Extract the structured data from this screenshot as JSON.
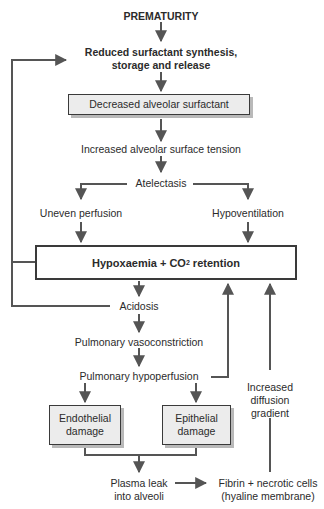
{
  "diagram": {
    "nodes": {
      "prematurity": "PREMATURITY",
      "reduced_synthesis_line1": "Reduced surfactant synthesis,",
      "reduced_synthesis_line2": "storage and release",
      "decreased_surfactant": "Decreased alveolar surfactant",
      "surface_tension": "Increased alveolar surface tension",
      "atelectasis": "Atelectasis",
      "uneven_perfusion": "Uneven perfusion",
      "hypoventilation": "Hypoventilation",
      "hypoxaemia_prefix": "Hypoxaemia + CO",
      "hypoxaemia_sub": "2",
      "hypoxaemia_suffix": " retention",
      "acidosis": "Acidosis",
      "vasoconstriction": "Pulmonary vasoconstriction",
      "hypoperfusion": "Pulmonary hypoperfusion",
      "endothelial_line1": "Endothelial",
      "endothelial_line2": "damage",
      "epithelial_line1": "Epithelial",
      "epithelial_line2": "damage",
      "diffusion_line1": "Increased",
      "diffusion_line2": "diffusion",
      "diffusion_line3": "gradient",
      "plasma_line1": "Plasma leak",
      "plasma_line2": "into alveoli",
      "fibrin_line1": "Fibrin + necrotic cells",
      "fibrin_line2": "(hyaline membrane)"
    },
    "colors": {
      "line": "#555555",
      "box_fill": "#ececec",
      "box_shadow": "#b9b9b9",
      "border": "#3a3a3a"
    }
  }
}
